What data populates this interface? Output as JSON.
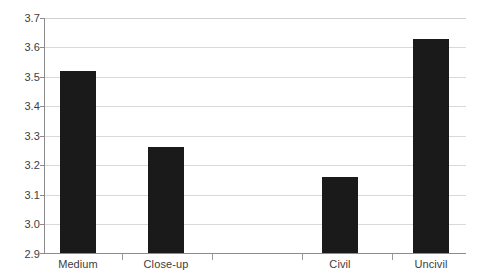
{
  "chart_data": {
    "type": "bar",
    "title": "",
    "subtitle": "",
    "xlabel": "",
    "ylabel": "",
    "categories": [
      "Medium",
      "Close-up",
      "Civil",
      "Uncivil"
    ],
    "values": [
      3.52,
      3.26,
      3.16,
      3.63
    ],
    "series": [
      {
        "name": "",
        "values": [
          3.52,
          3.26,
          3.16,
          3.63
        ]
      }
    ],
    "ylim": [
      2.9,
      3.7
    ],
    "ytick_labels": [
      "3.7",
      "3.6",
      "3.5",
      "3.4",
      "3.3",
      "3.2",
      "3.1",
      "3.0",
      "2.9"
    ],
    "ytick_values": [
      3.7,
      3.6,
      3.5,
      3.4,
      3.3,
      3.2,
      3.1,
      3.0,
      2.9
    ],
    "grid": true,
    "grid_axis": "y",
    "legend": false,
    "legend_position": "none",
    "bar_color": "#1a1a1a",
    "grid_color": "#d9d9d9",
    "axis_color": "#8c8c8c",
    "label_color": "#3d3d3d",
    "annotations": []
  }
}
